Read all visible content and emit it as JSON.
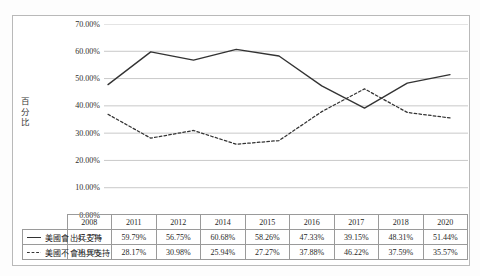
{
  "chart_data": {
    "type": "line",
    "title": "",
    "xlabel": "",
    "ylabel": "百分比",
    "categories": [
      "2008",
      "2011",
      "2012",
      "2014",
      "2015",
      "2016",
      "2017",
      "2018",
      "2020"
    ],
    "ylim": [
      0,
      70
    ],
    "ytick_labels": [
      "70.00%",
      "60.00%",
      "50.00%",
      "40.00%",
      "30.00%",
      "20.00%",
      "10.00%",
      "0.00%"
    ],
    "ytick_values": [
      70,
      60,
      50,
      40,
      30,
      20,
      10,
      0
    ],
    "grid": true,
    "legend_position": "bottom-table",
    "series": [
      {
        "name": "美國會出兵支持",
        "style": "solid",
        "color": "#333333",
        "values": [
          47.77,
          59.79,
          56.75,
          60.68,
          58.26,
          47.33,
          39.15,
          48.31,
          51.44
        ],
        "labels": [
          "47.77%",
          "59.79%",
          "56.75%",
          "60.68%",
          "58.26%",
          "47.33%",
          "39.15%",
          "48.31%",
          "51.44%"
        ]
      },
      {
        "name": "美國不會出兵支持",
        "style": "dotted",
        "color": "#333333",
        "values": [
          36.9,
          28.17,
          30.98,
          25.94,
          27.27,
          37.88,
          46.22,
          37.59,
          35.57
        ],
        "labels": [
          "36.90%",
          "28.17%",
          "30.98%",
          "25.94%",
          "27.27%",
          "37.88%",
          "46.22%",
          "37.59%",
          "35.57%"
        ]
      }
    ]
  },
  "colors": {
    "line": "#333333",
    "grid": "#c9c9c9",
    "frame": "#b9b9b9",
    "table_border": "#9a9a9a",
    "background": "#ffffff"
  }
}
